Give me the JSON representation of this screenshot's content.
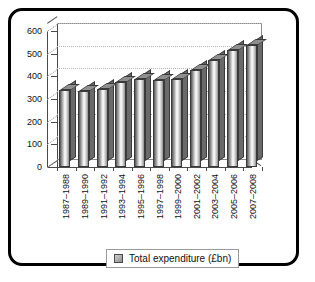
{
  "chart_data": {
    "type": "bar",
    "title": "",
    "xlabel": "",
    "ylabel": "",
    "ylim": [
      0,
      600
    ],
    "yticks": [
      0,
      100,
      200,
      300,
      400,
      500,
      600
    ],
    "grid": true,
    "legend_position": "bottom",
    "categories": [
      "1987–1988",
      "1989–1990",
      "1991–1992",
      "1993–1994",
      "1995–1996",
      "1997–1998",
      "1999–2000",
      "2001–2002",
      "2003–2004",
      "2005–2006",
      "2007–2008"
    ],
    "series": [
      {
        "name": "Total expenditure (£bn)",
        "values": [
          340,
          335,
          345,
          375,
          388,
          385,
          390,
          430,
          470,
          515,
          540
        ]
      }
    ]
  },
  "legend": {
    "label": "Total expenditure (£bn)"
  },
  "colors": {
    "frame": "#000000",
    "bar_dark": "#4e4e4e",
    "bar_light": "#ffffff",
    "bar_side": "#6a6a6a",
    "grid": "#b4b4b4",
    "axis": "#4a4a4a"
  }
}
